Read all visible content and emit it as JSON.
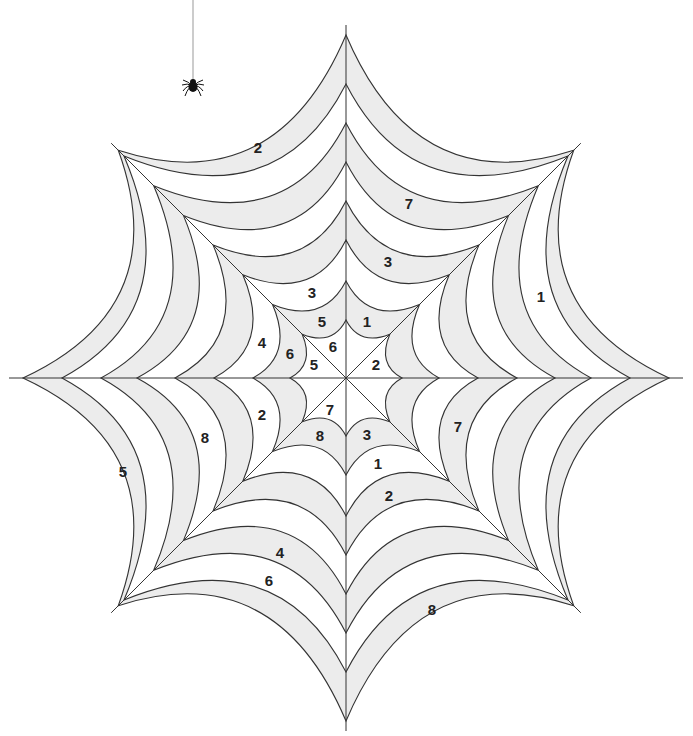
{
  "puzzle": {
    "type": "color-by-number spider web",
    "center": [
      346,
      378
    ],
    "colors": {
      "shaded_band": "#ececec",
      "white_band": "#ffffff",
      "line": "#333333",
      "number_text": "#222222",
      "spider": "#111111"
    },
    "rings": {
      "count": 8,
      "horizontal_radii": [
        56,
        93,
        132,
        171,
        209,
        245,
        284,
        323
      ],
      "vertical_radii": [
        58,
        97,
        138,
        177,
        216,
        255,
        294,
        343
      ],
      "diagonal_radii": [
        62,
        104,
        146,
        188,
        230,
        272,
        314,
        322
      ]
    },
    "spider": {
      "thread_top": [
        193,
        0
      ],
      "body": [
        193,
        86
      ]
    },
    "labels": [
      {
        "id": "l1",
        "text": "2",
        "x": 258,
        "y": 147
      },
      {
        "id": "l2",
        "text": "7",
        "x": 409,
        "y": 203
      },
      {
        "id": "l3",
        "text": "3",
        "x": 388,
        "y": 261
      },
      {
        "id": "l4",
        "text": "1",
        "x": 541,
        "y": 296
      },
      {
        "id": "l5",
        "text": "3",
        "x": 312,
        "y": 292
      },
      {
        "id": "l6",
        "text": "5",
        "x": 322,
        "y": 321
      },
      {
        "id": "l7",
        "text": "1",
        "x": 367,
        "y": 321
      },
      {
        "id": "l8",
        "text": "4",
        "x": 262,
        "y": 342
      },
      {
        "id": "l9",
        "text": "6",
        "x": 290,
        "y": 353
      },
      {
        "id": "l10",
        "text": "6",
        "x": 333,
        "y": 346
      },
      {
        "id": "l11",
        "text": "5",
        "x": 314,
        "y": 364
      },
      {
        "id": "l12",
        "text": "2",
        "x": 376,
        "y": 364
      },
      {
        "id": "l13",
        "text": "2",
        "x": 262,
        "y": 414
      },
      {
        "id": "l14",
        "text": "8",
        "x": 205,
        "y": 437
      },
      {
        "id": "l15",
        "text": "7",
        "x": 330,
        "y": 409
      },
      {
        "id": "l16",
        "text": "8",
        "x": 320,
        "y": 435
      },
      {
        "id": "l17",
        "text": "3",
        "x": 367,
        "y": 434
      },
      {
        "id": "l18",
        "text": "7",
        "x": 458,
        "y": 426
      },
      {
        "id": "l19",
        "text": "1",
        "x": 378,
        "y": 463
      },
      {
        "id": "l20",
        "text": "2",
        "x": 389,
        "y": 495
      },
      {
        "id": "l21",
        "text": "5",
        "x": 123,
        "y": 471
      },
      {
        "id": "l22",
        "text": "4",
        "x": 280,
        "y": 552
      },
      {
        "id": "l23",
        "text": "6",
        "x": 269,
        "y": 580
      },
      {
        "id": "l24",
        "text": "8",
        "x": 432,
        "y": 609
      }
    ]
  }
}
